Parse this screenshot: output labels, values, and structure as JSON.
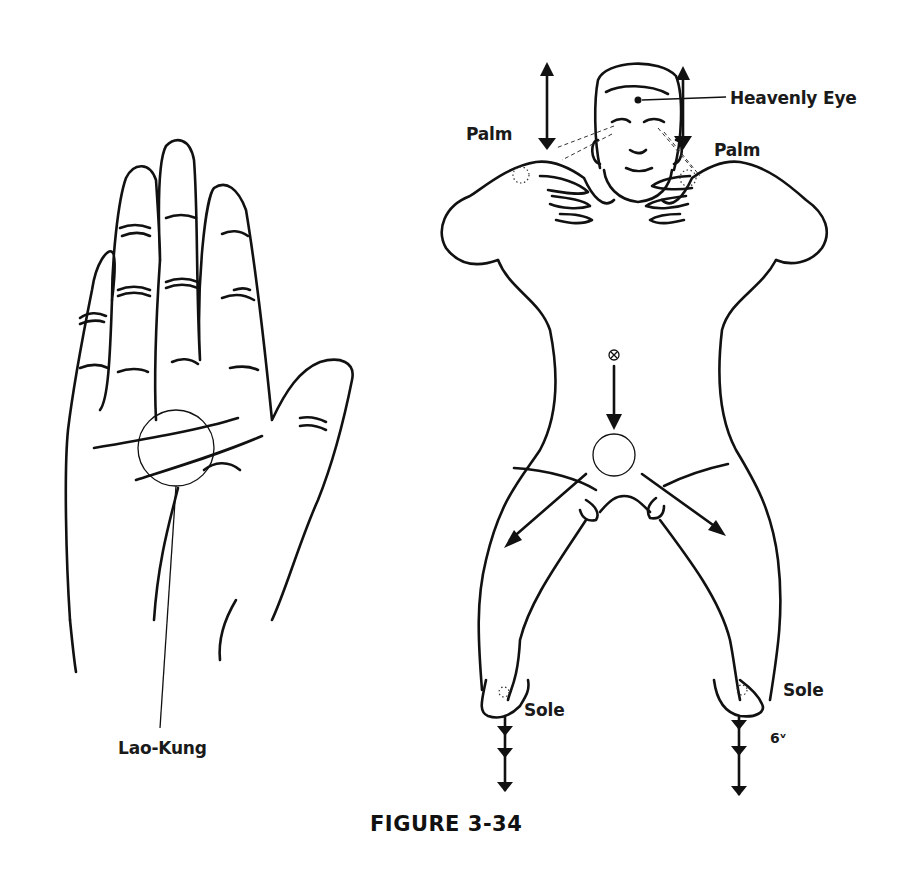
{
  "figure": {
    "caption": "FIGURE 3-34",
    "hand_diagram": {
      "point_label": "Lao-Kung"
    },
    "body_diagram": {
      "labels": {
        "heavenly_eye": "Heavenly Eye",
        "palm_left": "Palm",
        "palm_right": "Palm",
        "sole_left": "Sole",
        "sole_right": "Sole",
        "annotation": "6ᵛ"
      }
    }
  }
}
